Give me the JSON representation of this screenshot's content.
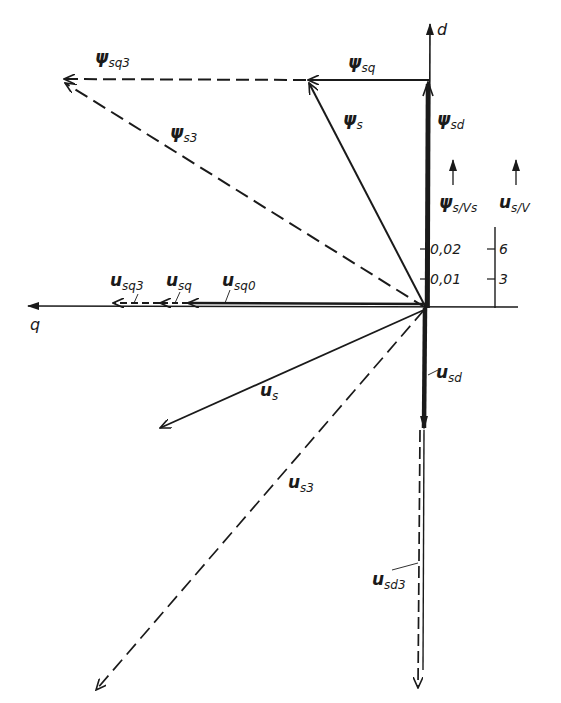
{
  "diagram": {
    "type": "phasor-vector-diagram",
    "axes": {
      "d_label": "d",
      "q_label": "q"
    },
    "vectors": {
      "psi_sq3": {
        "main": "ψ",
        "sub": "sq3",
        "style": "dashed"
      },
      "psi_sq": {
        "main": "ψ",
        "sub": "sq",
        "style": "solid"
      },
      "psi_s3": {
        "main": "ψ",
        "sub": "s3",
        "style": "dashed"
      },
      "psi_s": {
        "main": "ψ",
        "sub": "s",
        "style": "solid"
      },
      "psi_sd": {
        "main": "ψ",
        "sub": "sd",
        "style": "bold"
      },
      "u_sq3": {
        "main": "u",
        "sub": "sq3",
        "style": "dashed"
      },
      "u_sq": {
        "main": "u",
        "sub": "sq",
        "style": "dashed"
      },
      "u_sq0": {
        "main": "u",
        "sub": "sq0",
        "style": "solid"
      },
      "u_s": {
        "main": "u",
        "sub": "s",
        "style": "solid"
      },
      "u_s3": {
        "main": "u",
        "sub": "s3",
        "style": "dashed"
      },
      "u_sd": {
        "main": "u",
        "sub": "sd",
        "style": "bold"
      },
      "u_sd3": {
        "main": "u",
        "sub": "sd3",
        "style": "dashed"
      }
    },
    "scales": {
      "flux": {
        "label_main": "ψ",
        "label_sub": "s/Vs",
        "ticks": [
          "0,01",
          "0,02"
        ]
      },
      "voltage": {
        "label_main": "u",
        "label_sub": "s/V",
        "ticks": [
          "3",
          "6"
        ]
      }
    }
  }
}
